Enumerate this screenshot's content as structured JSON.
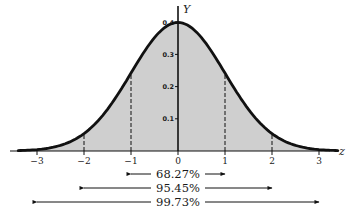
{
  "chart_data": {
    "type": "area",
    "title": "",
    "xlabel": "z",
    "ylabel": "Y",
    "xlim": [
      -3.3,
      3.3
    ],
    "ylim": [
      0,
      0.4
    ],
    "x_ticks": [
      -3,
      -2,
      -1,
      0,
      1,
      2,
      3
    ],
    "x_tick_labels": [
      "−3",
      "−2",
      "−1",
      "0",
      "1",
      "2",
      "3"
    ],
    "y_ticks": [
      0.1,
      0.2,
      0.3,
      0.4
    ],
    "y_tick_labels": [
      "0.1",
      "0.2",
      "0.3",
      "0.4"
    ],
    "curve": "standard normal density Y = (1/√(2π)) e^(−z²/2)",
    "series": [
      {
        "name": "Standard normal density",
        "x": [
          -3,
          -2.5,
          -2,
          -1.5,
          -1,
          -0.5,
          0,
          0.5,
          1,
          1.5,
          2,
          2.5,
          3
        ],
        "values": [
          0.0044,
          0.0175,
          0.054,
          0.1295,
          0.242,
          0.3521,
          0.3989,
          0.3521,
          0.242,
          0.1295,
          0.054,
          0.0175,
          0.0044
        ]
      }
    ],
    "dashed_verticals": [
      -2,
      -1,
      1,
      2
    ],
    "annotations": [
      {
        "label": "68.27%",
        "from": -1,
        "to": 1
      },
      {
        "label": "95.45%",
        "from": -2,
        "to": 2
      },
      {
        "label": "99.73%",
        "from": -3,
        "to": 3
      }
    ],
    "grid": false,
    "legend": "none",
    "colors": {
      "fill": "#cfcfcf",
      "curve": "#111111",
      "axis": "#111111"
    }
  }
}
